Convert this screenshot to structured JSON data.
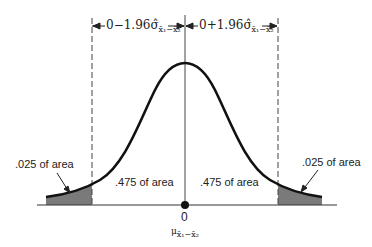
{
  "diagram": {
    "type": "normal-distribution-two-tailed",
    "left_interval_label": "0−1.96σ̂",
    "left_interval_sub": "x̄₁−x̄₂",
    "right_interval_label": "0+1.96σ̂",
    "right_interval_sub": "x̄₁−x̄₂",
    "left_tail_label": ".025 of area",
    "right_tail_label": ".025 of area",
    "left_center_label": ".475 of area",
    "right_center_label": ".475 of area",
    "center_value": "0",
    "center_mu": "μ",
    "center_mu_sub": "x̄₁−x̄₂",
    "colors": {
      "curve": "#111111",
      "shade": "#7a7a7a",
      "line": "#333333"
    }
  }
}
